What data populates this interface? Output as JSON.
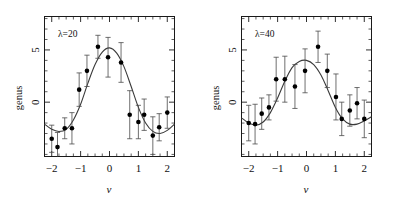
{
  "figure": {
    "background": "#ffffff",
    "ink_color": "#111111",
    "curve_color": "#3a3a3a",
    "marker_color": "#000000",
    "errorbar_color": "#4a4a4a",
    "panel_count": 2
  },
  "chart_data": [
    {
      "type": "scatter",
      "title": "",
      "annotation": "λ=20",
      "xlabel": "ν",
      "ylabel": "genus",
      "xlim": [
        -2.25,
        2.25
      ],
      "ylim": [
        -5.2,
        8.2
      ],
      "xticks": [
        -2,
        -1,
        0,
        1,
        2
      ],
      "xticklabels": [
        "−2",
        "−1",
        "0",
        "1",
        "2"
      ],
      "yticks": [
        0,
        5
      ],
      "yticklabels": [
        "0",
        "5"
      ],
      "grid": false,
      "legend": "none",
      "x": [
        -2.0,
        -1.8,
        -1.55,
        -1.3,
        -1.05,
        -0.78,
        -0.4,
        -0.05,
        0.4,
        0.7,
        1.0,
        1.2,
        1.5,
        1.72,
        2.0
      ],
      "y": [
        -3.5,
        -4.3,
        -2.5,
        -2.5,
        1.2,
        3.0,
        5.3,
        4.3,
        3.8,
        -1.2,
        -1.9,
        -1.2,
        -3.2,
        -2.4,
        -1.0
      ],
      "yerr": [
        1.3,
        1.4,
        1.0,
        1.5,
        1.6,
        1.5,
        1.1,
        1.9,
        1.9,
        2.3,
        1.6,
        1.5,
        1.8,
        1.3,
        1.5
      ],
      "series": [
        {
          "name": "genus data (λ=20)",
          "x": [
            -2.0,
            -1.8,
            -1.55,
            -1.3,
            -1.05,
            -0.78,
            -0.4,
            -0.05,
            0.4,
            0.7,
            1.0,
            1.2,
            1.5,
            1.72,
            2.0
          ],
          "values": [
            -3.5,
            -4.3,
            -2.5,
            -2.5,
            1.2,
            3.0,
            5.3,
            4.3,
            3.8,
            -1.2,
            -1.9,
            -1.2,
            -3.2,
            -2.4,
            -1.0
          ],
          "yerr": [
            1.3,
            1.4,
            1.0,
            1.5,
            1.6,
            1.5,
            1.1,
            1.9,
            1.9,
            2.3,
            1.6,
            1.5,
            1.8,
            1.3,
            1.5
          ]
        },
        {
          "name": "fitted genus curve (λ=20)",
          "type": "line",
          "amplitude": 5.2,
          "x": [
            -2.25,
            -2.0,
            -1.75,
            -1.5,
            -1.25,
            -1.0,
            -0.75,
            -0.5,
            -0.25,
            0.0,
            0.25,
            0.5,
            0.75,
            1.0,
            1.25,
            1.5,
            1.75,
            2.0,
            2.25
          ],
          "values": [
            -2.1,
            -2.6,
            -2.8,
            -2.6,
            -1.7,
            -0.2,
            1.8,
            3.6,
            4.8,
            5.2,
            4.7,
            3.4,
            1.5,
            -0.5,
            -2.0,
            -2.8,
            -3.0,
            -2.7,
            -2.1
          ]
        }
      ]
    },
    {
      "type": "scatter",
      "title": "",
      "annotation": "λ=40",
      "xlabel": "ν",
      "ylabel": "genus",
      "xlim": [
        -2.25,
        2.25
      ],
      "ylim": [
        -5.2,
        8.2
      ],
      "xticks": [
        -2,
        -1,
        0,
        1,
        2
      ],
      "xticklabels": [
        "−2",
        "−1",
        "0",
        "1",
        "2"
      ],
      "yticks": [
        0,
        5
      ],
      "yticklabels": [
        "0",
        "5"
      ],
      "grid": false,
      "legend": "none",
      "x": [
        -2.0,
        -1.78,
        -1.55,
        -1.3,
        -1.05,
        -0.75,
        -0.4,
        -0.05,
        0.4,
        0.72,
        1.02,
        1.22,
        1.5,
        1.75,
        2.0
      ],
      "y": [
        -2.0,
        -2.1,
        -1.1,
        -0.5,
        2.2,
        2.2,
        1.5,
        3.0,
        5.3,
        3.0,
        0.5,
        -1.6,
        -0.8,
        -0.1,
        -1.6
      ],
      "yerr": [
        1.7,
        1.9,
        1.5,
        1.2,
        2.1,
        2.2,
        2.1,
        2.1,
        1.5,
        1.6,
        2.2,
        1.6,
        1.5,
        1.5,
        1.8
      ],
      "series": [
        {
          "name": "genus data (λ=40)",
          "x": [
            -2.0,
            -1.78,
            -1.55,
            -1.3,
            -1.05,
            -0.75,
            -0.4,
            -0.05,
            0.4,
            0.72,
            1.02,
            1.22,
            1.5,
            1.75,
            2.0
          ],
          "values": [
            -2.0,
            -2.1,
            -1.1,
            -0.5,
            2.2,
            2.2,
            1.5,
            3.0,
            5.3,
            3.0,
            0.5,
            -1.6,
            -0.8,
            -0.1,
            -1.6
          ],
          "yerr": [
            1.7,
            1.9,
            1.5,
            1.2,
            2.1,
            2.2,
            2.1,
            2.1,
            1.5,
            1.6,
            2.2,
            1.6,
            1.5,
            1.5,
            1.8
          ]
        },
        {
          "name": "fitted genus curve (λ=40)",
          "type": "line",
          "amplitude": 4.0,
          "x": [
            -2.25,
            -2.0,
            -1.75,
            -1.5,
            -1.25,
            -1.0,
            -0.75,
            -0.5,
            -0.25,
            0.0,
            0.25,
            0.5,
            0.75,
            1.0,
            1.25,
            1.5,
            1.75,
            2.0,
            2.25
          ],
          "values": [
            -1.5,
            -2.0,
            -2.2,
            -1.9,
            -1.0,
            0.4,
            2.0,
            3.3,
            3.9,
            4.0,
            3.6,
            2.6,
            1.1,
            -0.5,
            -1.6,
            -2.1,
            -2.1,
            -1.8,
            -1.4
          ]
        }
      ]
    }
  ]
}
